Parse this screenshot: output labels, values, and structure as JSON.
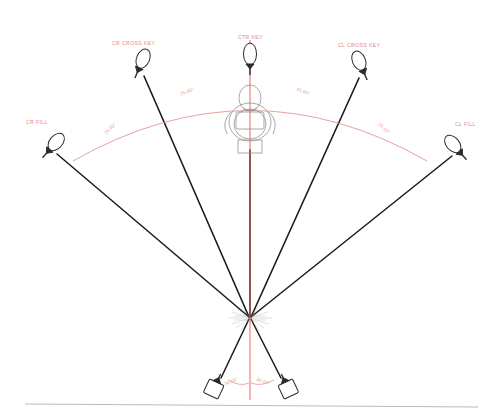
{
  "diagram": {
    "colors": {
      "ray": "#1a1a1a",
      "axis": "#e8453c",
      "arc": "#e08a84",
      "label": "#e58a84",
      "angle": "#e7948d",
      "fixture_outline": "#2b2b2b",
      "subject": "#8c8c8c",
      "ground_rule": "#b9bcc2",
      "background": "#ffffff"
    },
    "subject": {
      "name": "subject-head-top-view",
      "x": 250,
      "y": 122
    },
    "convergence_point": {
      "x": 250,
      "y": 318
    },
    "fixtures": [
      {
        "id": "cr-fill",
        "label": "CR FILL",
        "label_x": 26,
        "label_y": 122,
        "head_x": 51,
        "head_y": 148,
        "angle_deg": -49
      },
      {
        "id": "cr-cross-key",
        "label": "CR CROSS KEY",
        "label_x": 112,
        "label_y": 43,
        "head_x": 140,
        "head_y": 66,
        "angle_deg": -24
      },
      {
        "id": "ctr-key",
        "label": "CTR KEY",
        "label_x": 240,
        "label_y": 37,
        "head_x": 250,
        "head_y": 62,
        "angle_deg": 0
      },
      {
        "id": "cl-cross-key",
        "label": "CL CROSS KEY",
        "label_x": 340,
        "label_y": 45,
        "head_x": 362,
        "head_y": 68,
        "angle_deg": 24
      },
      {
        "id": "cl-fill",
        "label": "CL FILL",
        "label_x": 455,
        "label_y": 124,
        "head_x": 458,
        "head_y": 150,
        "angle_deg": 49
      },
      {
        "id": "cr-back",
        "label": "",
        "head_x": 216,
        "head_y": 384,
        "angle_deg": 200
      },
      {
        "id": "cl-back",
        "label": "",
        "head_x": 286,
        "head_y": 384,
        "angle_deg": 160
      }
    ],
    "angle_labels": [
      {
        "id": "angle-cr-fill-arc",
        "text": "25.00°",
        "x": 107,
        "y": 129,
        "rotate": -42
      },
      {
        "id": "angle-cr-cross-arc",
        "text": "25.00°",
        "x": 182,
        "y": 92,
        "rotate": -22
      },
      {
        "id": "angle-cl-cross-arc",
        "text": "25.00°",
        "x": 300,
        "y": 92,
        "rotate": 22
      },
      {
        "id": "angle-cl-fill-arc",
        "text": "25.00°",
        "x": 380,
        "y": 128,
        "rotate": 42
      },
      {
        "id": "angle-cr-back",
        "text": "30.00°",
        "x": 222,
        "y": 380,
        "rotate": -20
      },
      {
        "id": "angle-cl-back",
        "text": "30.00°",
        "x": 258,
        "y": 380,
        "rotate": 20
      }
    ],
    "center_axis": {
      "x": 250,
      "y1": 40,
      "y2": 400
    },
    "arc": {
      "cx": 250,
      "cy": 318,
      "radius": 232,
      "start_deg": 230,
      "end_deg": 310
    },
    "ground_rule": {
      "x1": 25,
      "y1": 404,
      "x2": 478,
      "y2": 407
    }
  }
}
